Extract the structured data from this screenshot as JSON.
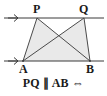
{
  "figure": {
    "type": "geometry-diagram",
    "background_color": "#ffffff",
    "line_color": "#3a3a3a",
    "fill_color": "#e9e9e9",
    "label_color": "#1a1a1a",
    "points": {
      "P": {
        "label": "P",
        "x": 37,
        "y": 18
      },
      "Q": {
        "label": "Q",
        "x": 84,
        "y": 18
      },
      "A": {
        "label": "A",
        "x": 23,
        "y": 61
      },
      "B": {
        "label": "B",
        "x": 90,
        "y": 61
      }
    },
    "lines": {
      "top_line": {
        "name": "line-through-P-Q",
        "y": 18,
        "x1": 4,
        "x2": 104,
        "arrow": "left"
      },
      "bottom_line": {
        "name": "line-through-A-B",
        "y": 61,
        "x1": 4,
        "x2": 104,
        "arrow": "left"
      }
    },
    "segments": [
      {
        "name": "segment-PA",
        "from": "P",
        "to": "A"
      },
      {
        "name": "segment-PB",
        "from": "P",
        "to": "B"
      },
      {
        "name": "segment-QA",
        "from": "Q",
        "to": "A"
      },
      {
        "name": "segment-QB",
        "from": "Q",
        "to": "B"
      }
    ],
    "shaded_triangles": [
      {
        "name": "triangle-PAB",
        "vertices": [
          "P",
          "A",
          "B"
        ]
      },
      {
        "name": "triangle-QAB",
        "vertices": [
          "Q",
          "A",
          "B"
        ]
      }
    ]
  },
  "caption": {
    "text": "PQ ∥ AB ⇔"
  }
}
